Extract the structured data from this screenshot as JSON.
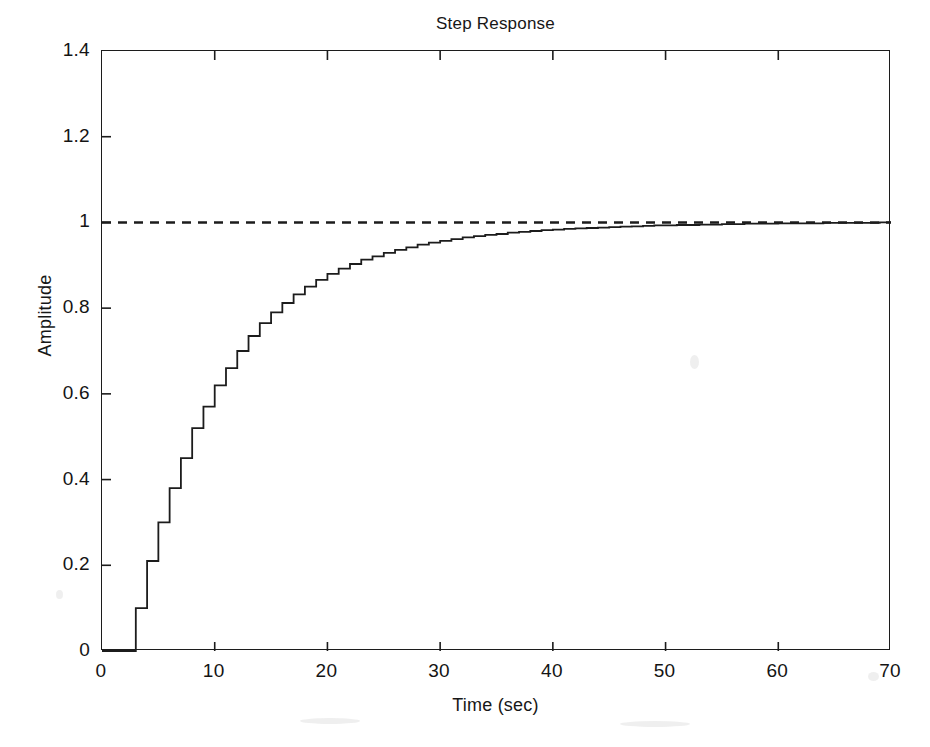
{
  "figure": {
    "background_color": "#ffffff",
    "ink_color": "#1c1c1c"
  },
  "chart_data": {
    "type": "line",
    "title": "Step Response",
    "xlabel": "Time (sec)",
    "ylabel": "Amplitude",
    "xlim": [
      0,
      70
    ],
    "ylim": [
      0,
      1.4
    ],
    "xticks": [
      0,
      10,
      20,
      30,
      40,
      50,
      60,
      70
    ],
    "yticks": [
      0,
      0.2,
      0.4,
      0.6,
      0.8,
      1,
      1.2,
      1.4
    ],
    "xtick_labels": [
      "0",
      "10",
      "20",
      "30",
      "40",
      "50",
      "60",
      "70"
    ],
    "ytick_labels": [
      "0",
      "0.2",
      "0.4",
      "0.6",
      "0.8",
      "1",
      "1.2",
      "1.4"
    ],
    "grid": false,
    "legend": null,
    "series": [
      {
        "name": "Step response (discrete, zero-order hold)",
        "style": "staircase",
        "line_style": "solid",
        "color": "#1c1c1c",
        "sample_time_sec": 1,
        "dead_time_sec": 3,
        "steady_state": 1.0,
        "x": [
          0,
          1,
          2,
          3,
          4,
          5,
          6,
          7,
          8,
          9,
          10,
          11,
          12,
          13,
          14,
          15,
          16,
          17,
          18,
          19,
          20,
          21,
          22,
          23,
          24,
          25,
          26,
          27,
          28,
          29,
          30,
          31,
          32,
          33,
          34,
          35,
          36,
          37,
          38,
          39,
          40,
          41,
          42,
          43,
          44,
          45,
          46,
          47,
          48,
          49,
          50,
          51,
          52,
          53,
          54,
          55,
          56,
          57,
          58,
          59,
          60,
          61,
          62,
          63,
          64,
          65,
          66,
          67,
          68,
          69,
          70
        ],
        "y": [
          0,
          0,
          0,
          0.1,
          0.21,
          0.3,
          0.38,
          0.45,
          0.52,
          0.57,
          0.62,
          0.66,
          0.7,
          0.735,
          0.765,
          0.79,
          0.812,
          0.832,
          0.85,
          0.866,
          0.88,
          0.892,
          0.903,
          0.913,
          0.921,
          0.929,
          0.936,
          0.942,
          0.948,
          0.953,
          0.957,
          0.961,
          0.965,
          0.968,
          0.971,
          0.973,
          0.976,
          0.978,
          0.98,
          0.982,
          0.983,
          0.985,
          0.986,
          0.987,
          0.988,
          0.989,
          0.99,
          0.991,
          0.992,
          0.993,
          0.993,
          0.994,
          0.994,
          0.995,
          0.995,
          0.996,
          0.996,
          0.997,
          0.997,
          0.997,
          0.998,
          0.998,
          0.998,
          0.998,
          0.999,
          0.999,
          0.999,
          0.999,
          0.999,
          1.0,
          1.0
        ]
      },
      {
        "name": "Final value reference",
        "style": "horizontal-line",
        "line_style": "dashed",
        "color": "#1c1c1c",
        "value": 1.0
      }
    ]
  }
}
